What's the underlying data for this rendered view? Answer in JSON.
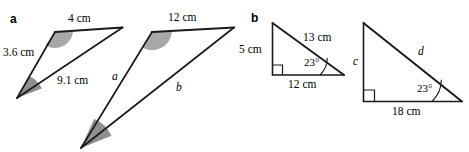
{
  "figure": {
    "background_color": "#ffffff",
    "stroke_color": "#1a1a1a",
    "angle_fill_color": "#9c9c9c",
    "angle_fill_color_light": "#bdbdbd"
  },
  "parts": {
    "a": {
      "label": "a"
    },
    "b": {
      "label": "b"
    }
  },
  "triangles": [
    {
      "id": "part-a-small-triangle",
      "part": "a",
      "labels": {
        "top_side": "4 cm",
        "left_side": "3.6 cm",
        "bottom_side": "9.1 cm"
      }
    },
    {
      "id": "part-a-large-triangle",
      "part": "a",
      "labels": {
        "top_side": "12 cm",
        "left_side": "a",
        "bottom_side": "b"
      }
    },
    {
      "id": "part-b-small-triangle",
      "part": "b",
      "labels": {
        "vertical_side": "5 cm",
        "hypotenuse": "13 cm",
        "base": "12 cm",
        "angle": "23°"
      }
    },
    {
      "id": "part-b-large-triangle",
      "part": "b",
      "labels": {
        "vertical_side": "c",
        "hypotenuse": "d",
        "base": "18 cm",
        "angle": "23°"
      }
    }
  ]
}
